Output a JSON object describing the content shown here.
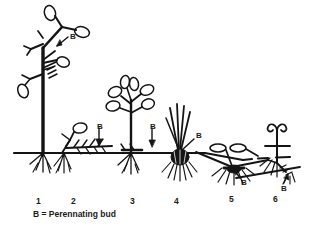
{
  "figure": {
    "caption": "B = Perennating bud",
    "ground_label": "soil surface line",
    "ink_color": "#141414",
    "background_color": "#ffffff"
  },
  "bud_labels": [
    {
      "id": "bud-label-1",
      "text": "B",
      "x": 70,
      "y": 32,
      "plant": 1
    },
    {
      "id": "bud-label-2",
      "text": "B",
      "x": 97,
      "y": 122,
      "plant": 2
    },
    {
      "id": "bud-label-3",
      "text": "B",
      "x": 150,
      "y": 122,
      "plant": 3
    },
    {
      "id": "bud-label-4",
      "text": "B",
      "x": 196,
      "y": 136,
      "plant": 4
    },
    {
      "id": "bud-label-5",
      "text": "B",
      "x": 241,
      "y": 180,
      "plant": 5
    },
    {
      "id": "bud-label-6",
      "text": "B",
      "x": 281,
      "y": 186,
      "plant": 6
    }
  ],
  "number_labels": [
    {
      "id": "plant-number-1",
      "text": "1",
      "x": 36,
      "y": 198
    },
    {
      "id": "plant-number-2",
      "text": "2",
      "x": 71,
      "y": 198
    },
    {
      "id": "plant-number-3",
      "text": "3",
      "x": 130,
      "y": 198
    },
    {
      "id": "plant-number-4",
      "text": "4",
      "x": 174,
      "y": 198
    },
    {
      "id": "plant-number-5",
      "text": "5",
      "x": 229,
      "y": 198
    },
    {
      "id": "plant-number-6",
      "text": "6",
      "x": 273,
      "y": 198
    }
  ],
  "caption_pos": {
    "x": 33,
    "y": 209
  },
  "plants": [
    {
      "number": 1,
      "name": "tall woody shrub",
      "bud_position": "aerial on upright stem"
    },
    {
      "number": 2,
      "name": "creeping stolon herb",
      "bud_position": "at soil surface"
    },
    {
      "number": 3,
      "name": "upright leafy herb",
      "bud_position": "at soil surface"
    },
    {
      "number": 4,
      "name": "bulb with grass leaves",
      "bud_position": "in bulb at surface"
    },
    {
      "number": 5,
      "name": "looping rhizome plant",
      "bud_position": "below soil on rhizome"
    },
    {
      "number": 6,
      "name": "coiled subterranean shoot",
      "bud_position": "deep below soil"
    }
  ]
}
